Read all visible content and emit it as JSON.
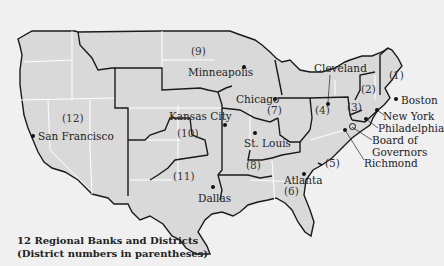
{
  "legend": {
    "line1": "12 Regional Banks and Districts",
    "line2": "(District numbers in parentheses)"
  },
  "colors": {
    "background": "#f0f0f0",
    "land": "#d9d9d9",
    "district_border": "#1a1a1a",
    "state_border": "#ffffff"
  },
  "districts": [
    {
      "number": "(1)",
      "city": "Boston"
    },
    {
      "number": "(2)",
      "city": "New York"
    },
    {
      "number": "(3)",
      "city": "Philadelphia"
    },
    {
      "number": "(4)",
      "city": "Cleveland"
    },
    {
      "number": "(5)",
      "city": "Richmond"
    },
    {
      "number": "(6)",
      "city": "Atlanta"
    },
    {
      "number": "(7)",
      "city": "Chicago"
    },
    {
      "number": "(8)",
      "city": "St. Louis"
    },
    {
      "number": "(9)",
      "city": "Minneapolis"
    },
    {
      "number": "(10)",
      "city": "Kansas City"
    },
    {
      "number": "(11)",
      "city": "Dallas"
    },
    {
      "number": "(12)",
      "city": "San Francisco"
    }
  ],
  "extra_labels": {
    "board_line1": "Board of",
    "board_line2": "Governors"
  }
}
